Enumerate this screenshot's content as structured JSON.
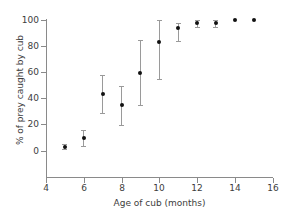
{
  "chart_data": {
    "type": "scatter",
    "title": "",
    "xlabel": "Age of cub (months)",
    "ylabel": "% of prey caught by cub",
    "xlim": [
      4,
      16
    ],
    "ylim": [
      0,
      100
    ],
    "xticks": [
      4,
      6,
      8,
      10,
      12,
      14,
      16
    ],
    "yticks": [
      0,
      20,
      40,
      60,
      80,
      100
    ],
    "grid": false,
    "legend": false,
    "error_bars": "vertical",
    "marker_color": "#111111",
    "errorbar_color": "#9a9a9a",
    "axis_color": "#8a8a8a",
    "background_color": "#ffffff",
    "x": [
      5,
      6,
      7,
      8,
      9,
      10,
      11,
      12,
      13,
      14,
      15
    ],
    "values": [
      3,
      9.5,
      43.5,
      34.5,
      59.5,
      82.5,
      93.5,
      97,
      97,
      99.5,
      99.5
    ],
    "yerr_low": [
      2,
      6,
      14.5,
      15,
      25,
      28,
      10,
      3,
      3,
      0,
      0
    ],
    "yerr_high": [
      2,
      6,
      14.5,
      15,
      25,
      17,
      4,
      3,
      3,
      0,
      0
    ],
    "points": [
      {
        "x": 5,
        "y": 3,
        "low": 1,
        "high": 5
      },
      {
        "x": 6,
        "y": 9.5,
        "low": 3.5,
        "high": 15.5
      },
      {
        "x": 7,
        "y": 43.5,
        "low": 29,
        "high": 58
      },
      {
        "x": 8,
        "y": 34.5,
        "low": 19.5,
        "high": 49.5
      },
      {
        "x": 9,
        "y": 59.5,
        "low": 34.5,
        "high": 84.5
      },
      {
        "x": 10,
        "y": 82.5,
        "low": 54.5,
        "high": 99.5
      },
      {
        "x": 11,
        "y": 93.5,
        "low": 83.5,
        "high": 97.5
      },
      {
        "x": 12,
        "y": 97,
        "low": 94,
        "high": 100
      },
      {
        "x": 13,
        "y": 97,
        "low": 94,
        "high": 100
      },
      {
        "x": 14,
        "y": 99.5,
        "low": 99.5,
        "high": 99.5
      },
      {
        "x": 15,
        "y": 99.5,
        "low": 99.5,
        "high": 99.5
      }
    ]
  }
}
